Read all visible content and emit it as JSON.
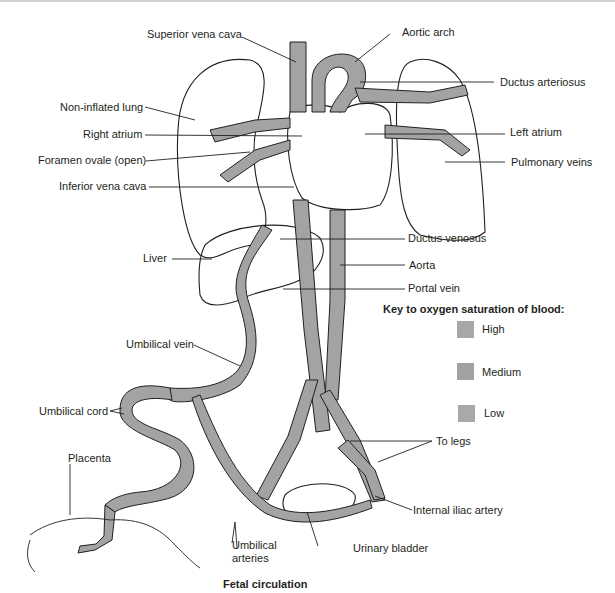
{
  "figure": {
    "caption": "Fetal circulation"
  },
  "labels": {
    "superior_vena_cava": "Superior vena cava",
    "aortic_arch": "Aortic arch",
    "ductus_arteriosus": "Ductus arteriosus",
    "non_inflated_lung": "Non-inflated lung",
    "right_atrium": "Right atrium",
    "left_atrium": "Left atrium",
    "foramen_ovale": "Foramen ovale (open)",
    "pulmonary_veins": "Pulmonary veins",
    "inferior_vena_cava": "Inferior vena cava",
    "ductus_venosus": "Ductus venosus",
    "liver": "Liver",
    "aorta": "Aorta",
    "portal_vein": "Portal vein",
    "umbilical_vein": "Umbilical vein",
    "umbilical_cord": "Umbilical cord",
    "to_legs": "To legs",
    "placenta": "Placenta",
    "internal_iliac_artery": "Internal iliac artery",
    "umbilical_arteries_line1": "Umbilical",
    "umbilical_arteries_line2": "arteries",
    "urinary_bladder": "Urinary bladder"
  },
  "key": {
    "title": "Key to oxygen saturation of blood:",
    "items": [
      {
        "label": "High",
        "color": "#a7a7a7"
      },
      {
        "label": "Medium",
        "color": "#a2a2a2"
      },
      {
        "label": "Low",
        "color": "#a9a9a9"
      }
    ]
  },
  "colors": {
    "vessel_fill": "#a3a3a3",
    "outline": "#231f20",
    "background": "#ffffff"
  }
}
